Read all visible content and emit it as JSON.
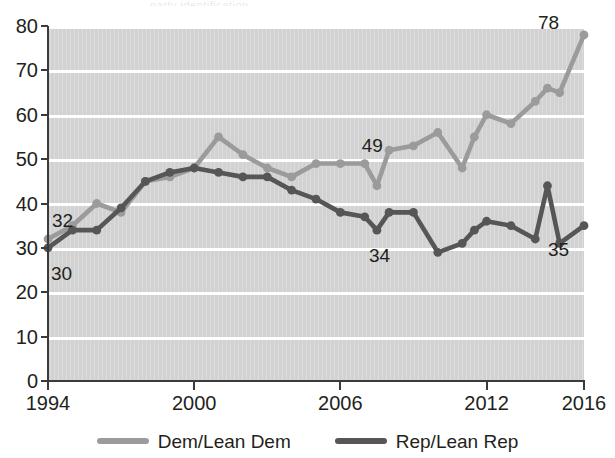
{
  "top_sliver_text": "party identification",
  "colors": {
    "dem": "#9b9b9b",
    "rep": "#565656",
    "plot_bg": "#d2d2d2",
    "grid": "#ffffff",
    "axis": "#3b3b3b",
    "text": "#231f20"
  },
  "legend": {
    "items": [
      {
        "label": "Dem/Lean Dem",
        "color": "#9b9b9b",
        "swatch": "line-swatch"
      },
      {
        "label": "Rep/Lean Rep",
        "color": "#565656",
        "swatch": "line-swatch"
      }
    ]
  },
  "axes": {
    "y_ticks": [
      "80",
      "70",
      "60",
      "50",
      "40",
      "30",
      "20",
      "10",
      "0"
    ],
    "x_ticks": [
      "1994",
      "2000",
      "2006",
      "2012",
      "2016"
    ]
  },
  "annotations": [
    {
      "name": "dem-start-label",
      "text": "32"
    },
    {
      "name": "rep-start-label",
      "text": "30"
    },
    {
      "name": "dem-mid-label",
      "text": "49"
    },
    {
      "name": "rep-mid-label",
      "text": "34"
    },
    {
      "name": "dem-end-label",
      "text": "78"
    },
    {
      "name": "rep-end-label",
      "text": "35"
    }
  ],
  "chart_data": {
    "type": "line",
    "title": "",
    "subtitle": "",
    "xlabel": "",
    "ylabel": "",
    "xlim": [
      1994,
      2016
    ],
    "ylim": [
      0,
      80
    ],
    "y_tick_step": 10,
    "grid": "horizontal",
    "legend_position": "bottom-center",
    "x": [
      1994,
      1995,
      1996,
      1997,
      1998,
      1999,
      2000,
      2001,
      2002,
      2003,
      2004,
      2005,
      2006,
      2007,
      2007.5,
      2008,
      2009,
      2010,
      2011,
      2011.5,
      2012,
      2013,
      2014,
      2014.5,
      2015,
      2016
    ],
    "series": [
      {
        "name": "Dem/Lean Dem",
        "color": "#9b9b9b",
        "values": [
          32,
          35,
          40,
          38,
          45,
          46,
          48,
          55,
          51,
          48,
          46,
          49,
          49,
          49,
          44,
          52,
          53,
          56,
          48,
          55,
          60,
          58,
          63,
          66,
          65,
          78
        ],
        "labeled_points": [
          {
            "x": 1994,
            "value": 32
          },
          {
            "x": 2007,
            "value": 49
          },
          {
            "x": 2016,
            "value": 78
          }
        ]
      },
      {
        "name": "Rep/Lean Rep",
        "color": "#565656",
        "values": [
          30,
          34,
          34,
          39,
          45,
          47,
          48,
          47,
          46,
          46,
          43,
          41,
          38,
          37,
          34,
          38,
          38,
          29,
          31,
          34,
          36,
          35,
          32,
          44,
          31,
          35
        ],
        "labeled_points": [
          {
            "x": 1994,
            "value": 30
          },
          {
            "x": 2008,
            "value": 34
          },
          {
            "x": 2016,
            "value": 35
          }
        ]
      }
    ]
  }
}
